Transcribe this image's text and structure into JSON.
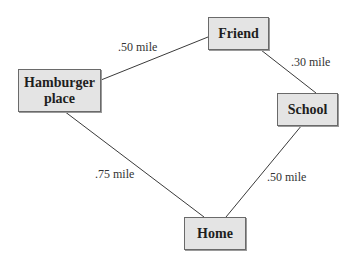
{
  "nodes": {
    "friend": {
      "label": "Friend"
    },
    "hamburger": {
      "label": "Hamburger place"
    },
    "school": {
      "label": "School"
    },
    "home": {
      "label": "Home"
    }
  },
  "edges": [
    {
      "from": "Hamburger place",
      "to": "Friend",
      "label": ".50 mile"
    },
    {
      "from": "Friend",
      "to": "School",
      "label": ".30 mile"
    },
    {
      "from": "Hamburger place",
      "to": "Home",
      "label": ".75 mile"
    },
    {
      "from": "School",
      "to": "Home",
      "label": ".50 mile"
    }
  ]
}
